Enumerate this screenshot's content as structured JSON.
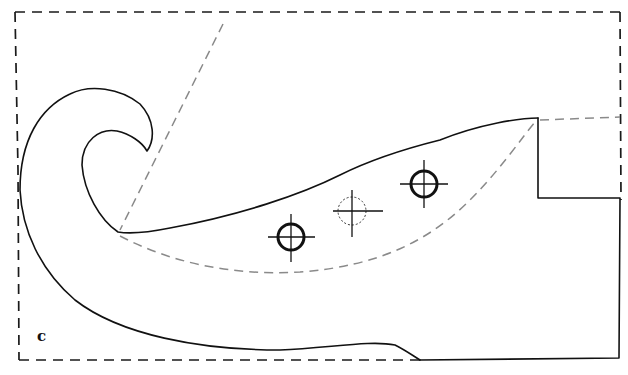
{
  "figure": {
    "panel_label": "c",
    "colors": {
      "line": "#111111",
      "outline_dash": "#1a1a1a",
      "guide_dash": "#8a8a8a",
      "background": "#ffffff"
    },
    "markers": [
      {
        "name": "hole-marker-left",
        "style": "solid",
        "cx": 291,
        "cy": 237,
        "r": 13
      },
      {
        "name": "hole-marker-middle",
        "style": "dashed",
        "cx": 352,
        "cy": 211,
        "r": 14
      },
      {
        "name": "hole-marker-right",
        "style": "solid",
        "cx": 424,
        "cy": 184,
        "r": 13
      }
    ]
  }
}
